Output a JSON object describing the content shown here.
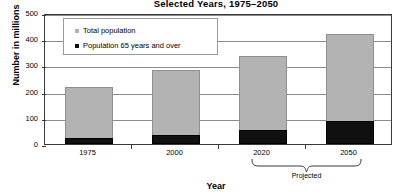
{
  "chart_data": {
    "type": "bar",
    "subtype": "stacked-vertical",
    "title": "Selected Years, 1975–2050",
    "xlabel": "Year",
    "ylabel": "Number in millions",
    "categories": [
      "1975",
      "2000",
      "2020",
      "2050"
    ],
    "series": [
      {
        "name": "Total population",
        "color": "#b3b3b3",
        "values": [
          216,
          282,
          336,
          420
        ]
      },
      {
        "name": "Population 65 years and over",
        "color": "#101010",
        "values": [
          22,
          35,
          53,
          87
        ]
      }
    ],
    "ylim": [
      0,
      500
    ],
    "yticks": [
      0,
      100,
      200,
      300,
      400,
      500
    ],
    "ytick_labels": [
      "0",
      "100",
      "200",
      "300",
      "400",
      "500"
    ],
    "grid": true,
    "grid_axis": "y",
    "legend_position": "upper-left-inside",
    "annotations": [
      {
        "type": "brace",
        "label": "Projected",
        "spans_categories": [
          "2020",
          "2050"
        ]
      }
    ]
  },
  "legend": {
    "entries": [
      {
        "label": "Total population",
        "swatch": "#b3b3b3",
        "marker": "square-gray-icon"
      },
      {
        "label": "Population 65 years and over",
        "swatch": "#101010",
        "marker": "square-black-icon"
      }
    ]
  }
}
